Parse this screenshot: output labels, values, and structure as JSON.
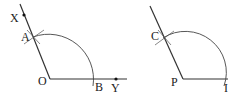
{
  "figures": [
    {
      "id": "left",
      "vertex": {
        "label": "O",
        "x": 50,
        "y": 79
      },
      "ray1_end": {
        "x": 127,
        "y": 79
      },
      "ray2_end": {
        "x": 20,
        "y": 4
      },
      "points": [
        {
          "label": "X",
          "x": 24,
          "y": 15,
          "dot": true
        },
        {
          "label": "A",
          "x": 33,
          "y": 38,
          "dot": false
        },
        {
          "label": "B",
          "x": 95,
          "y": 79,
          "dot": false
        },
        {
          "label": "Y",
          "x": 116,
          "y": 79,
          "dot": true
        }
      ],
      "arc_radius": 45
    },
    {
      "id": "right",
      "vertex": {
        "label": "P",
        "x": 183,
        "y": 79
      },
      "ray1_end": {
        "x": 228,
        "y": 79
      },
      "ray2_end": {
        "x": 150,
        "y": 6
      },
      "points": [
        {
          "label": "C",
          "x": 164,
          "y": 37,
          "dot": false
        },
        {
          "label": "I",
          "x": 224,
          "y": 79,
          "dot": false
        }
      ],
      "arc_radius": 41
    }
  ],
  "labels": {
    "X": "X",
    "A": "A",
    "O": "O",
    "B": "B",
    "Y": "Y",
    "C": "C",
    "P": "P",
    "I": "I"
  }
}
